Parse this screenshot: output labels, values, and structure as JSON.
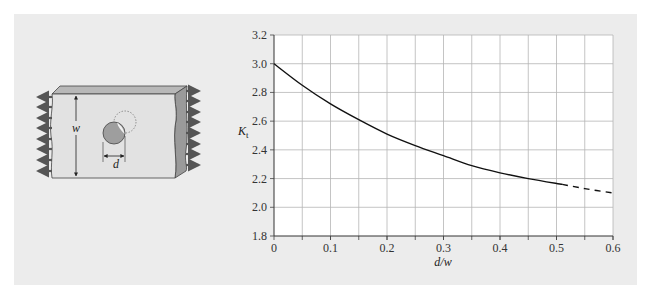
{
  "figure": {
    "diagram": {
      "label_width": "w",
      "label_diameter": "d",
      "description": "Plate with central hole under uniaxial tension"
    }
  },
  "chart_data": {
    "type": "line",
    "title": "",
    "xlabel": "d/w",
    "ylabel": "K",
    "ylabel_subscript": "t",
    "xlim": [
      0,
      0.6
    ],
    "ylim": [
      1.8,
      3.2
    ],
    "x_ticks": [
      "0",
      "0.1",
      "0.2",
      "0.3",
      "0.4",
      "0.5",
      "0.6"
    ],
    "y_ticks": [
      "1.8",
      "2.0",
      "2.2",
      "2.4",
      "2.6",
      "2.8",
      "3.0",
      "3.2"
    ],
    "grid": true,
    "grid_x_step": 0.05,
    "grid_y_step": 0.2,
    "series": [
      {
        "name": "Kt (solid)",
        "style": "solid",
        "x": [
          0,
          0.05,
          0.1,
          0.15,
          0.2,
          0.25,
          0.3,
          0.35,
          0.4,
          0.45,
          0.51
        ],
        "y": [
          3.0,
          2.85,
          2.72,
          2.61,
          2.51,
          2.43,
          2.36,
          2.29,
          2.24,
          2.2,
          2.16
        ]
      },
      {
        "name": "Kt (extrapolated)",
        "style": "dashed",
        "x": [
          0.51,
          0.55,
          0.6
        ],
        "y": [
          2.16,
          2.13,
          2.1
        ]
      }
    ]
  }
}
